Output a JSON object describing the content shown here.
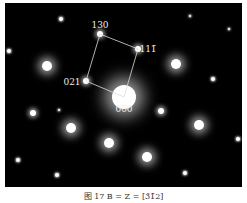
{
  "figure": {
    "caption": "图 17   B = Z = [3̄1̄2]",
    "labels": [
      {
        "text": "130",
        "x": 100,
        "y": 25
      },
      {
        "text": "111̄",
        "x": 148,
        "y": 49
      },
      {
        "text": "021",
        "x": 72,
        "y": 82
      },
      {
        "text": "000",
        "x": 124,
        "y": 109
      }
    ],
    "cell": [
      [
        100,
        34
      ],
      [
        138,
        49
      ],
      [
        124,
        97
      ],
      [
        86,
        81
      ]
    ],
    "spots": [
      {
        "x": 124,
        "y": 97,
        "r": 12,
        "blur": 8
      },
      {
        "x": 100,
        "y": 34,
        "r": 3,
        "blur": 2
      },
      {
        "x": 138,
        "y": 49,
        "r": 3,
        "blur": 2
      },
      {
        "x": 86,
        "y": 81,
        "r": 3,
        "blur": 2
      },
      {
        "x": 47,
        "y": 66,
        "r": 5,
        "blur": 4
      },
      {
        "x": 176,
        "y": 64,
        "r": 5,
        "blur": 4
      },
      {
        "x": 71,
        "y": 128,
        "r": 5,
        "blur": 4
      },
      {
        "x": 109,
        "y": 143,
        "r": 5,
        "blur": 4
      },
      {
        "x": 147,
        "y": 157,
        "r": 5,
        "blur": 4
      },
      {
        "x": 199,
        "y": 125,
        "r": 5,
        "blur": 4
      },
      {
        "x": 161,
        "y": 111,
        "r": 3,
        "blur": 2
      },
      {
        "x": 33,
        "y": 113,
        "r": 3,
        "blur": 2
      },
      {
        "x": 61,
        "y": 19,
        "r": 2,
        "blur": 1
      },
      {
        "x": 9,
        "y": 51,
        "r": 2,
        "blur": 1
      },
      {
        "x": 213,
        "y": 79,
        "r": 2,
        "blur": 1
      },
      {
        "x": 238,
        "y": 139,
        "r": 2,
        "blur": 1
      },
      {
        "x": 18,
        "y": 160,
        "r": 2,
        "blur": 1
      },
      {
        "x": 57,
        "y": 175,
        "r": 2,
        "blur": 1
      },
      {
        "x": 185,
        "y": 173,
        "r": 2,
        "blur": 1
      },
      {
        "x": 190,
        "y": 16,
        "r": 1,
        "blur": 1
      },
      {
        "x": 229,
        "y": 29,
        "r": 1,
        "blur": 1
      },
      {
        "x": 59,
        "y": 110,
        "r": 1,
        "blur": 1
      }
    ]
  }
}
